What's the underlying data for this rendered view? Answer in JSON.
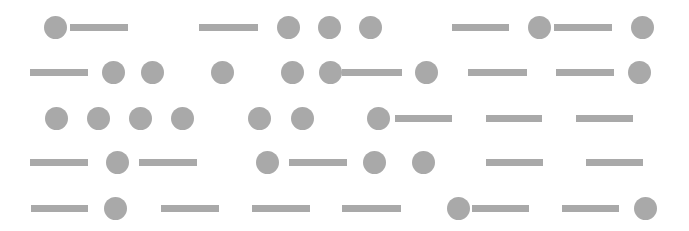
{
  "style": {
    "background": "#ffffff",
    "shape_color": "#a9a9a9",
    "dot_diameter": 23,
    "dash_height": 7
  },
  "rows": [
    {
      "y": 27,
      "elements": [
        {
          "type": "dot",
          "x": 55
        },
        {
          "type": "dash",
          "x1": 70,
          "x2": 128
        },
        {
          "type": "dash",
          "x1": 199,
          "x2": 258
        },
        {
          "type": "dot",
          "x": 288
        },
        {
          "type": "dot",
          "x": 329
        },
        {
          "type": "dot",
          "x": 370
        },
        {
          "type": "dash",
          "x1": 452,
          "x2": 509
        },
        {
          "type": "dot",
          "x": 539
        },
        {
          "type": "dash",
          "x1": 554,
          "x2": 612
        },
        {
          "type": "dot",
          "x": 642
        }
      ]
    },
    {
      "y": 72,
      "elements": [
        {
          "type": "dash",
          "x1": 30,
          "x2": 88
        },
        {
          "type": "dot",
          "x": 113
        },
        {
          "type": "dot",
          "x": 152
        },
        {
          "type": "dot",
          "x": 222
        },
        {
          "type": "dot",
          "x": 292
        },
        {
          "type": "dot",
          "x": 330
        },
        {
          "type": "dash",
          "x1": 342,
          "x2": 402
        },
        {
          "type": "dot",
          "x": 426
        },
        {
          "type": "dash",
          "x1": 468,
          "x2": 527
        },
        {
          "type": "dash",
          "x1": 556,
          "x2": 614
        },
        {
          "type": "dot",
          "x": 639
        }
      ]
    },
    {
      "y": 118,
      "elements": [
        {
          "type": "dot",
          "x": 56
        },
        {
          "type": "dot",
          "x": 98
        },
        {
          "type": "dot",
          "x": 140
        },
        {
          "type": "dot",
          "x": 182
        },
        {
          "type": "dot",
          "x": 259
        },
        {
          "type": "dot",
          "x": 302
        },
        {
          "type": "dot",
          "x": 378
        },
        {
          "type": "dash",
          "x1": 395,
          "x2": 452
        },
        {
          "type": "dash",
          "x1": 486,
          "x2": 542
        },
        {
          "type": "dash",
          "x1": 576,
          "x2": 633
        }
      ]
    },
    {
      "y": 162,
      "elements": [
        {
          "type": "dash",
          "x1": 30,
          "x2": 88
        },
        {
          "type": "dot",
          "x": 117
        },
        {
          "type": "dash",
          "x1": 139,
          "x2": 197
        },
        {
          "type": "dot",
          "x": 267
        },
        {
          "type": "dash",
          "x1": 289,
          "x2": 347
        },
        {
          "type": "dot",
          "x": 374
        },
        {
          "type": "dot",
          "x": 423
        },
        {
          "type": "dash",
          "x1": 486,
          "x2": 543
        },
        {
          "type": "dash",
          "x1": 586,
          "x2": 643
        }
      ]
    },
    {
      "y": 208,
      "elements": [
        {
          "type": "dash",
          "x1": 31,
          "x2": 88
        },
        {
          "type": "dot",
          "x": 115
        },
        {
          "type": "dash",
          "x1": 161,
          "x2": 219
        },
        {
          "type": "dash",
          "x1": 252,
          "x2": 310
        },
        {
          "type": "dash",
          "x1": 342,
          "x2": 401
        },
        {
          "type": "dot",
          "x": 458
        },
        {
          "type": "dash",
          "x1": 472,
          "x2": 529
        },
        {
          "type": "dash",
          "x1": 562,
          "x2": 619
        },
        {
          "type": "dot",
          "x": 645
        }
      ]
    }
  ]
}
